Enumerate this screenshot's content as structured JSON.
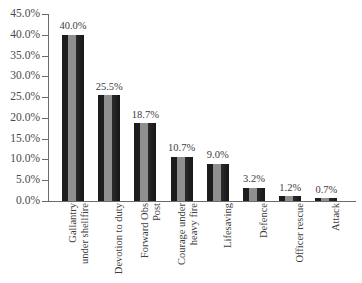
{
  "chart_data": {
    "type": "bar",
    "title": "",
    "subtitle": "",
    "xlabel": "",
    "ylabel": "",
    "ylim": [
      0,
      45
    ],
    "grid": false,
    "legend": "none",
    "value_label_format": "percent-one-decimal",
    "categories": [
      "Gallantry under shellfire",
      "Devotion to duty",
      "Forward Obs Post",
      "Courage under heavy fire",
      "Lifesaving",
      "Defence",
      "Officer rescue",
      "Attack"
    ],
    "category_lines": [
      [
        "Gallantry",
        "under shellfire"
      ],
      [
        "Devotion to duty",
        ""
      ],
      [
        "Forward Obs",
        "Post"
      ],
      [
        "Courage under",
        "heavy fire"
      ],
      [
        "Lifesaving",
        ""
      ],
      [
        "Defence",
        ""
      ],
      [
        "Officer rescue",
        ""
      ],
      [
        "Attack",
        ""
      ]
    ],
    "values": [
      40.0,
      25.5,
      18.7,
      10.7,
      9.0,
      3.2,
      1.2,
      0.7
    ],
    "value_labels": [
      "40.0%",
      "25.5%",
      "18.7%",
      "10.7%",
      "9.0%",
      "3.2%",
      "1.2%",
      "0.7%"
    ],
    "ytick_values": [
      0,
      5,
      10,
      15,
      20,
      25,
      30,
      35,
      40,
      45
    ],
    "ytick_labels": [
      "0.0%",
      "5.0%",
      "10.0%",
      "15.0%",
      "20.0%",
      "25.0%",
      "30.0%",
      "35.0%",
      "40.0%",
      "45.0%"
    ],
    "colors": {
      "bar_dark": "#1c1c1c",
      "bar_light": "#8f8f8f",
      "axis": "#6b6b6b",
      "text": "#3d3d3d",
      "background": "#ffffff"
    }
  }
}
